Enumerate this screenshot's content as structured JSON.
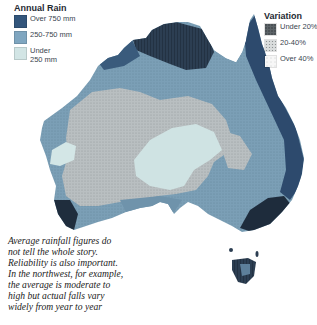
{
  "map": {
    "subject": "Australia annual rainfall and variation",
    "colors": {
      "over_750": "#2f4f74",
      "mid_250_750": "#7ea3bd",
      "under_250": "#d3e4e6",
      "high_variation_grey": "#b8bec0",
      "dark_reliable": "#1d2b3b",
      "background": "#ffffff"
    }
  },
  "rain_legend": {
    "title": "Annual Rain",
    "items": [
      {
        "label": "Over 750 mm",
        "color": "#33567c"
      },
      {
        "label": "250-750 mm",
        "color": "#7fa6c0"
      },
      {
        "label_line1": "Under",
        "label_line2": "250 mm",
        "color": "#d2e5e5"
      }
    ]
  },
  "variation_legend": {
    "title": "Variation",
    "items": [
      {
        "label": "Under 20%",
        "pattern": "dense-dark"
      },
      {
        "label": "20-40%",
        "pattern": "medium-dots"
      },
      {
        "label": "Over 40%",
        "pattern": "sparse-dots"
      }
    ]
  },
  "caption": {
    "lines": [
      "Average rainfall figures do",
      "not tell the whole story.",
      "Reliability is also important.",
      "In the northwest, for example,",
      "the average is moderate to",
      "high but actual falls vary",
      "widely from year to year"
    ]
  }
}
